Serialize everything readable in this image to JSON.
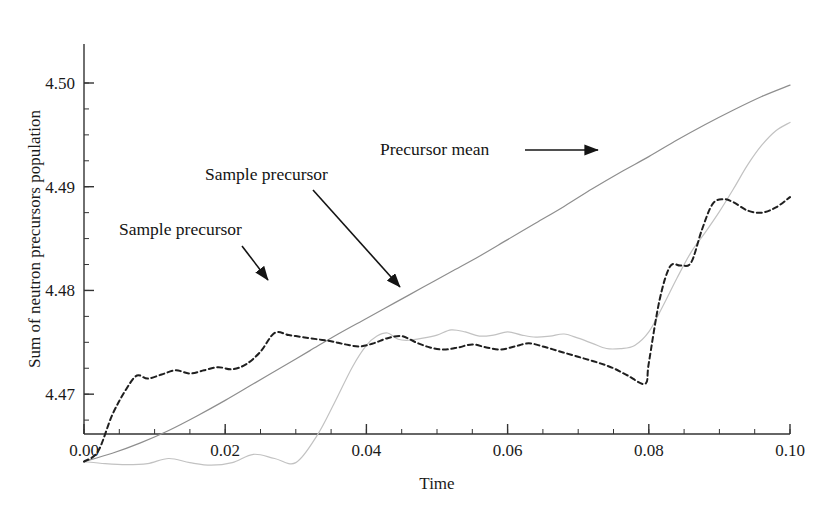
{
  "chart_data": {
    "type": "line",
    "title": "",
    "xlabel": "Time",
    "ylabel": "Sum of neutron precursors population",
    "xlim": [
      0.0,
      0.1
    ],
    "ylim": [
      4.4625,
      4.5005
    ],
    "grid": false,
    "legend_position": "inline-annotations",
    "x_ticks": [
      "0.00",
      "0.02",
      "0.04",
      "0.06",
      "0.08",
      "0.10"
    ],
    "x_tick_values": [
      0.0,
      0.02,
      0.04,
      0.06,
      0.08,
      0.1
    ],
    "x_minor_step": 0.005,
    "y_ticks": [
      "4.47",
      "4.48",
      "4.49",
      "4.50"
    ],
    "y_tick_values": [
      4.47,
      4.48,
      4.49,
      4.5
    ],
    "y_minor_step": 0.0025,
    "series": [
      {
        "name": "Precursor mean",
        "style": "solid",
        "color": "#8e8e8e",
        "width": 1.2,
        "x": [
          0.0,
          0.004,
          0.008,
          0.012,
          0.016,
          0.02,
          0.024,
          0.028,
          0.032,
          0.036,
          0.04,
          0.044,
          0.048,
          0.052,
          0.056,
          0.06,
          0.064,
          0.068,
          0.072,
          0.076,
          0.08,
          0.084,
          0.088,
          0.092,
          0.096,
          0.1
        ],
        "y": [
          4.4635,
          4.4643,
          4.4653,
          4.4665,
          4.4679,
          4.4694,
          4.471,
          4.4726,
          4.4742,
          4.4758,
          4.4773,
          4.4788,
          4.4803,
          4.4818,
          4.4833,
          4.4849,
          4.4865,
          4.4881,
          4.4898,
          4.4914,
          4.4929,
          4.4945,
          4.496,
          4.4974,
          4.4987,
          4.4998
        ]
      },
      {
        "name": "Sample precursor",
        "style": "solid",
        "color": "#c2c2c2",
        "width": 1.2,
        "x": [
          0.0,
          0.003,
          0.006,
          0.009,
          0.012,
          0.015,
          0.018,
          0.021,
          0.024,
          0.027,
          0.03,
          0.033,
          0.0355,
          0.038,
          0.04,
          0.0415,
          0.043,
          0.0445,
          0.046,
          0.048,
          0.05,
          0.052,
          0.054,
          0.056,
          0.058,
          0.06,
          0.062,
          0.064,
          0.066,
          0.068,
          0.07,
          0.072,
          0.074,
          0.076,
          0.078,
          0.08,
          0.082,
          0.084,
          0.086,
          0.088,
          0.09,
          0.092,
          0.094,
          0.096,
          0.098,
          0.1
        ],
        "y": [
          4.4635,
          4.4633,
          4.4632,
          4.4633,
          4.4638,
          4.4634,
          4.46315,
          4.4634,
          4.4642,
          4.4638,
          4.4634,
          4.466,
          4.4692,
          4.4726,
          4.4747,
          4.4756,
          4.4759,
          4.4753,
          4.4752,
          4.4754,
          4.4757,
          4.4762,
          4.476,
          4.4756,
          4.4757,
          4.476,
          4.4757,
          4.4755,
          4.4756,
          4.4758,
          4.4754,
          4.4749,
          4.4744,
          4.4744,
          4.4747,
          4.476,
          4.4785,
          4.4812,
          4.4837,
          4.4856,
          4.4876,
          4.4898,
          4.4921,
          4.494,
          4.4954,
          4.4962
        ]
      },
      {
        "name": "Sample precursor",
        "style": "dashed",
        "color": "#1f1f1f",
        "width": 2.0,
        "x": [
          0.0,
          0.002,
          0.004,
          0.006,
          0.0075,
          0.009,
          0.011,
          0.013,
          0.015,
          0.017,
          0.019,
          0.021,
          0.023,
          0.025,
          0.027,
          0.029,
          0.031,
          0.033,
          0.035,
          0.037,
          0.039,
          0.041,
          0.043,
          0.045,
          0.047,
          0.049,
          0.051,
          0.053,
          0.055,
          0.057,
          0.059,
          0.061,
          0.063,
          0.065,
          0.067,
          0.069,
          0.071,
          0.073,
          0.075,
          0.077,
          0.0795,
          0.08,
          0.0815,
          0.083,
          0.0845,
          0.086,
          0.0875,
          0.089,
          0.0905,
          0.092,
          0.094,
          0.096,
          0.098,
          0.1
        ],
        "y": [
          4.4635,
          4.4645,
          4.468,
          4.4705,
          4.4718,
          4.4715,
          4.4719,
          4.4723,
          4.472,
          4.4723,
          4.4726,
          4.4724,
          4.4729,
          4.4741,
          4.4759,
          4.4757,
          4.4755,
          4.4753,
          4.4751,
          4.4748,
          4.4746,
          4.4749,
          4.4754,
          4.4756,
          4.475,
          4.4745,
          4.4743,
          4.4745,
          4.4748,
          4.4745,
          4.4743,
          4.4746,
          4.4749,
          4.4746,
          4.4742,
          4.4738,
          4.4734,
          4.473,
          4.4725,
          4.4718,
          4.471,
          4.473,
          4.479,
          4.4823,
          4.4824,
          4.4827,
          4.4858,
          4.4883,
          4.4888,
          4.4885,
          4.4877,
          4.4875,
          4.488,
          4.489
        ]
      }
    ],
    "annotations": [
      {
        "id": "annot-sample-precursor-left",
        "label": "Sample precursor",
        "text_x": 119,
        "text_y": 235,
        "arrow_from_x": 242,
        "arrow_from_y": 246,
        "arrow_to_x": 268,
        "arrow_to_y": 280,
        "target_series": "Sample precursor (dashed)"
      },
      {
        "id": "annot-sample-precursor-mid",
        "label": "Sample precursor",
        "text_x": 205,
        "text_y": 180,
        "arrow_from_x": 313,
        "arrow_from_y": 190,
        "arrow_to_x": 400,
        "arrow_to_y": 287,
        "target_series": "Sample precursor (light gray)"
      },
      {
        "id": "annot-precursor-mean",
        "label": "Precursor mean",
        "text_x": 380,
        "text_y": 155,
        "arrow_from_x": 525,
        "arrow_from_y": 150,
        "arrow_to_x": 598,
        "arrow_to_y": 150,
        "target_series": "Precursor mean"
      }
    ],
    "colors": {
      "axis": "#333333",
      "text": "#1a1a1a",
      "mean_line": "#8e8e8e",
      "sample_light_line": "#c2c2c2",
      "sample_dashed_line": "#1f1f1f",
      "background": "#ffffff"
    },
    "geometry": {
      "left_px": 84,
      "right_px": 790,
      "top_px": 44,
      "bottom_px": 434,
      "y_at_top_px": 4.50376,
      "y_at_bottom_px": 4.46616
    }
  }
}
